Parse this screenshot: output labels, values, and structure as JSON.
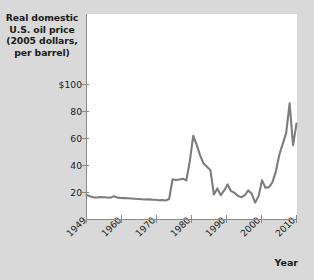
{
  "chart_data": {
    "type": "line",
    "title": "Real domestic U.S. oil price (2005 dollars, per barrel)",
    "title_lines": [
      "Real domestic",
      "U.S. oil price",
      "(2005 dollars,",
      "per barrel)"
    ],
    "xlabel": "Year",
    "ylabel": "Real domestic U.S. oil price (2005 dollars, per barrel)",
    "xlim": [
      1949,
      2010
    ],
    "ylim": [
      0,
      108
    ],
    "grid": false,
    "legend": false,
    "line_color": "#7d7d7d",
    "background_color": "#d9d9d9",
    "plot_background_color": "#ffffff",
    "axis_color": "#8a8a8a",
    "ytick_labels": [
      "$100",
      "80",
      "60",
      "40",
      "20"
    ],
    "ytick_values": [
      100,
      80,
      60,
      40,
      20
    ],
    "xtick_labels": [
      "1949",
      "1960",
      "1970",
      "1980",
      "1990",
      "2000",
      "2010"
    ],
    "xtick_values": [
      1949,
      1960,
      1970,
      1980,
      1990,
      2000,
      2010
    ],
    "x": [
      1949,
      1950,
      1951,
      1952,
      1953,
      1954,
      1955,
      1956,
      1957,
      1958,
      1959,
      1960,
      1961,
      1962,
      1963,
      1964,
      1965,
      1966,
      1967,
      1968,
      1969,
      1970,
      1971,
      1972,
      1973,
      1974,
      1975,
      1976,
      1977,
      1978,
      1979,
      1980,
      1981,
      1982,
      1983,
      1984,
      1985,
      1986,
      1987,
      1988,
      1989,
      1990,
      1991,
      1992,
      1993,
      1994,
      1995,
      1996,
      1997,
      1998,
      1999,
      2000,
      2001,
      2002,
      2003,
      2004,
      2005,
      2006,
      2007,
      2008,
      2009,
      2010
    ],
    "values": [
      18.2,
      17.2,
      16.4,
      16.3,
      16.6,
      16.5,
      16.3,
      16.2,
      17.2,
      16.2,
      15.9,
      15.8,
      15.7,
      15.6,
      15.4,
      15.2,
      15.0,
      14.8,
      14.9,
      14.7,
      14.6,
      14.3,
      14.4,
      14.1,
      15.2,
      29.8,
      29.2,
      29.6,
      30.2,
      29.0,
      43.0,
      62.0,
      55.5,
      47.5,
      41.5,
      39.0,
      36.5,
      18.5,
      23.0,
      18.0,
      21.5,
      26.0,
      21.0,
      19.8,
      17.5,
      16.5,
      18.0,
      21.5,
      19.0,
      12.5,
      17.5,
      29.0,
      23.5,
      24.0,
      27.5,
      35.5,
      48.0,
      56.0,
      64.0,
      86.0,
      55.0,
      71.0
    ],
    "series_name": "Real domestic U.S. oil price"
  }
}
